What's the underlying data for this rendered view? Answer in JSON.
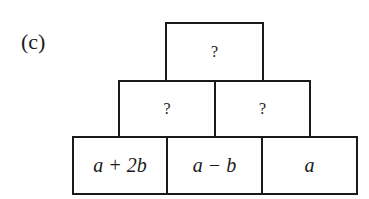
{
  "figure": {
    "label": "(c)",
    "pyramid": {
      "rows": [
        {
          "cells": [
            {
              "text": "?"
            }
          ]
        },
        {
          "cells": [
            {
              "text": "?"
            },
            {
              "text": "?"
            }
          ]
        },
        {
          "cells": [
            {
              "text": "a + 2b"
            },
            {
              "text": "a − b"
            },
            {
              "text": "a"
            }
          ]
        }
      ]
    }
  }
}
